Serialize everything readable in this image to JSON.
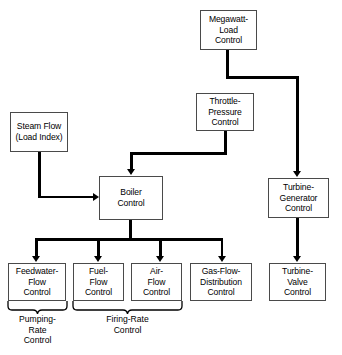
{
  "diagram": {
    "colors": {
      "background": "#ffffff",
      "box_border": "#4a4a4a",
      "connector": "#000000",
      "text": "#000000"
    },
    "nodes": [
      {
        "id": "megawatt-load-control",
        "label": "Megawatt-\nLoad\nControl"
      },
      {
        "id": "steam-flow-load-index",
        "label": "Steam Flow\n(Load Index)"
      },
      {
        "id": "throttle-pressure-control",
        "label": "Throttle-\nPressure\nControl"
      },
      {
        "id": "boiler-control",
        "label": "Boiler\nControl"
      },
      {
        "id": "turbine-generator-control",
        "label": "Turbine-\nGenerator\nControl"
      },
      {
        "id": "feedwater-flow-control",
        "label": "Feedwater-\nFlow\nControl"
      },
      {
        "id": "fuel-flow-control",
        "label": "Fuel-\nFlow\nControl"
      },
      {
        "id": "air-flow-control",
        "label": "Air-\nFlow\nControl"
      },
      {
        "id": "gas-flow-distribution-control",
        "label": "Gas-Flow-\nDistribution\nControl"
      },
      {
        "id": "turbine-valve-control",
        "label": "Turbine-\nValve\nControl"
      }
    ],
    "group_labels": [
      {
        "id": "pumping-rate-control",
        "label": "Pumping-\nRate\nControl"
      },
      {
        "id": "firing-rate-control",
        "label": "Firing-Rate\nControl"
      }
    ]
  }
}
